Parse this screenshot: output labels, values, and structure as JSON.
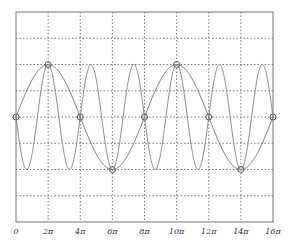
{
  "chart_data": {
    "type": "line",
    "title": "",
    "xlabel": "",
    "ylabel": "",
    "xlim": [
      0,
      16
    ],
    "x_unit": "π",
    "ylim": [
      -4,
      4
    ],
    "grid": true,
    "grid_style": "dotted",
    "x_ticks": [
      0,
      2,
      4,
      6,
      8,
      10,
      12,
      14,
      16
    ],
    "x_tick_labels": [
      "0",
      "2π",
      "4π",
      "6π",
      "8π",
      "10π",
      "12π",
      "14π",
      "16π"
    ],
    "y_ticks": [
      -4,
      -3,
      -2,
      -1,
      0,
      1,
      2,
      3,
      4
    ],
    "y_tick_labels": [],
    "series": [
      {
        "name": "slow",
        "formula": "2*sin(x/4), x in radians",
        "amplitude": 2,
        "period_pi": 8,
        "color": "#6e6e6e",
        "markers": {
          "x_pi": [
            0,
            2,
            4,
            6,
            8,
            10,
            12,
            14,
            16
          ],
          "y": [
            0,
            2,
            0,
            -2,
            0,
            2,
            0,
            -2,
            0
          ],
          "style": "open-circle"
        }
      },
      {
        "name": "fast",
        "formula": "-2*sin(3x/4), x in radians",
        "amplitude": 2,
        "period_pi": 2.6667,
        "color": "#8a8a8a"
      }
    ],
    "legend": null
  },
  "colors": {
    "frame": "#777777",
    "grid": "#555555",
    "slow": "#6e6e6e",
    "fast": "#8a8a8a",
    "marker": "#555555"
  }
}
